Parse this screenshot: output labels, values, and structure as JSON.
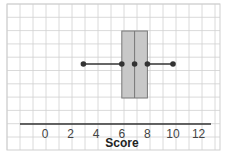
{
  "chart_data": {
    "type": "boxplot",
    "title": "",
    "xlabel": "Score",
    "ylabel": "",
    "xlim": [
      -2,
      13
    ],
    "xticks": [
      0,
      2,
      4,
      6,
      8,
      10,
      12
    ],
    "xtick_labels": [
      "0",
      "2",
      "4",
      "6",
      "8",
      "10",
      "12"
    ],
    "grid": true,
    "series": [
      {
        "name": "Score",
        "min": 3,
        "q1": 6,
        "median": 7,
        "q3": 8,
        "max": 10
      }
    ]
  },
  "colors": {
    "grid": "#d0d0d0",
    "box_fill": "#c8c8c8",
    "box_stroke": "#777777",
    "whisker": "#333333",
    "point": "#333333",
    "axis": "#333333"
  }
}
